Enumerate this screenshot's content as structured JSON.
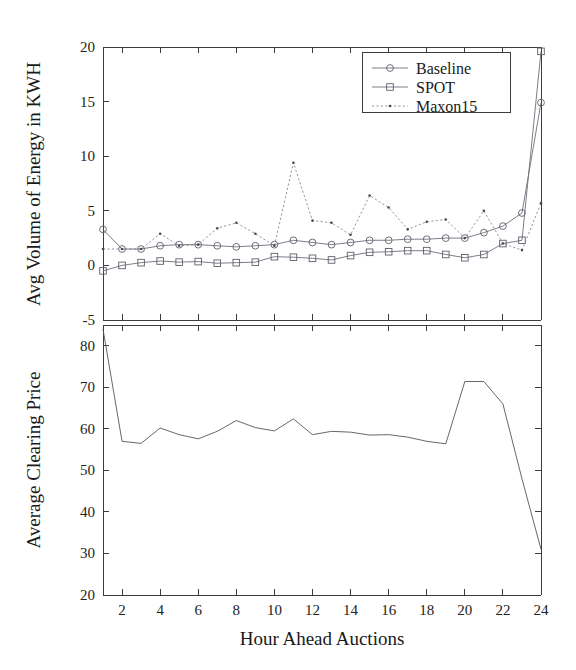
{
  "figure": {
    "width": 576,
    "height": 670,
    "background": "#ffffff",
    "line_color": "#6e6e7a",
    "axis_color": "#3c3c3c"
  },
  "chart_data": [
    {
      "type": "line",
      "panel": "top",
      "title": "",
      "xlabel": "",
      "ylabel": "Avg Volume of Energy in KWH",
      "x": [
        1,
        2,
        3,
        4,
        5,
        6,
        7,
        8,
        9,
        10,
        11,
        12,
        13,
        14,
        15,
        16,
        17,
        18,
        19,
        20,
        21,
        22,
        23,
        24
      ],
      "xlim": [
        1,
        24
      ],
      "ylim": [
        -5,
        20
      ],
      "xticks": [
        2,
        4,
        6,
        8,
        10,
        12,
        14,
        16,
        18,
        20,
        22,
        24
      ],
      "xticklabels": [
        "2",
        "4",
        "6",
        "8",
        "10",
        "12",
        "14",
        "16",
        "18",
        "20",
        "22",
        "24"
      ],
      "yticks": [
        -5,
        0,
        5,
        10,
        15,
        20
      ],
      "yticklabels": [
        "-5",
        "0",
        "5",
        "10",
        "15",
        "20"
      ],
      "grid": false,
      "legend_position": "upper right",
      "series": [
        {
          "name": "Baseline",
          "marker": "circle",
          "linestyle": "solid",
          "values": [
            3.3,
            1.5,
            1.5,
            1.8,
            1.9,
            1.9,
            1.8,
            1.7,
            1.8,
            1.9,
            2.3,
            2.1,
            1.9,
            2.1,
            2.3,
            2.3,
            2.4,
            2.4,
            2.5,
            2.5,
            3.0,
            3.6,
            4.8,
            14.9
          ]
        },
        {
          "name": "SPOT",
          "marker": "square",
          "linestyle": "solid",
          "values": [
            -0.5,
            0.0,
            0.25,
            0.4,
            0.3,
            0.35,
            0.2,
            0.25,
            0.3,
            0.8,
            0.75,
            0.65,
            0.5,
            0.9,
            1.2,
            1.25,
            1.35,
            1.35,
            1.0,
            0.7,
            1.0,
            2.0,
            2.3,
            19.6
          ]
        },
        {
          "name": "Maxon15",
          "marker": "dot",
          "linestyle": "dotted",
          "values": [
            1.5,
            1.5,
            1.5,
            2.9,
            1.8,
            1.9,
            3.4,
            3.9,
            2.9,
            1.8,
            9.4,
            4.1,
            3.9,
            2.8,
            6.4,
            5.3,
            3.3,
            4.0,
            4.2,
            2.5,
            5.0,
            2.0,
            1.4,
            5.7
          ]
        }
      ]
    },
    {
      "type": "line",
      "panel": "bottom",
      "title": "",
      "xlabel": "Hour Ahead Auctions",
      "ylabel": "Average Clearing Price",
      "x": [
        1,
        2,
        3,
        4,
        5,
        6,
        7,
        8,
        9,
        10,
        11,
        12,
        13,
        14,
        15,
        16,
        17,
        18,
        19,
        20,
        21,
        22,
        23,
        24
      ],
      "xlim": [
        1,
        24
      ],
      "ylim": [
        20,
        85
      ],
      "xticks": [
        2,
        4,
        6,
        8,
        10,
        12,
        14,
        16,
        18,
        20,
        22,
        24
      ],
      "xticklabels": [
        "2",
        "4",
        "6",
        "8",
        "10",
        "12",
        "14",
        "16",
        "18",
        "20",
        "22",
        "24"
      ],
      "yticks": [
        20,
        30,
        40,
        50,
        60,
        70,
        80
      ],
      "yticklabels": [
        "20",
        "30",
        "40",
        "50",
        "60",
        "70",
        "80"
      ],
      "grid": false,
      "legend_position": "none",
      "series": [
        {
          "name": "Average Clearing Price",
          "marker": "none",
          "linestyle": "solid",
          "values": [
            84.0,
            57.0,
            56.5,
            60.2,
            58.6,
            57.6,
            59.4,
            62.0,
            60.3,
            59.5,
            62.4,
            58.6,
            59.4,
            59.2,
            58.5,
            58.6,
            58.0,
            57.0,
            56.4,
            71.4,
            71.4,
            66.0,
            48.0,
            31.0
          ]
        }
      ]
    }
  ],
  "labels": {
    "top_ylabel": "Avg Volume of Energy in KWH",
    "bottom_ylabel": "Average Clearing Price",
    "xlabel": "Hour Ahead Auctions"
  },
  "legend": {
    "items": [
      {
        "label": "Baseline",
        "marker": "circle"
      },
      {
        "label": "SPOT",
        "marker": "square"
      },
      {
        "label": "Maxon15",
        "marker": "dot"
      }
    ]
  }
}
